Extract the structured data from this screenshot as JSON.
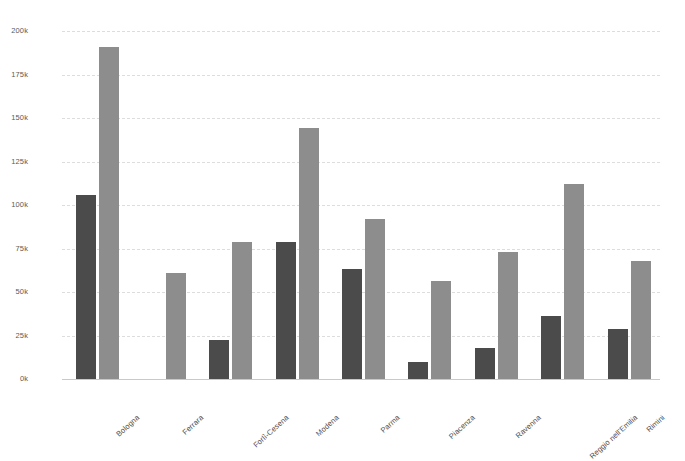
{
  "chart_data": {
    "type": "bar",
    "title": "",
    "subtitle": "",
    "xlabel": "",
    "ylabel": "",
    "ylim": [
      0,
      200000
    ],
    "grid": true,
    "legend_position": "none",
    "orientation": "vertical",
    "bar_mode": "grouped",
    "categories": [
      "Bologna",
      "Ferrara",
      "Forlì-Cesena",
      "Modena",
      "Parma",
      "Piacenza",
      "Ravenna",
      "Reggio nell'Emilia",
      "Rimini"
    ],
    "ytick_labels": [
      "0k",
      "25k",
      "50k",
      "75k",
      "100k",
      "125k",
      "150k",
      "175k",
      "200k"
    ],
    "ytick_values": [
      0,
      25000,
      50000,
      75000,
      100000,
      125000,
      150000,
      175000,
      200000
    ],
    "series": [
      {
        "name": "series-1",
        "color": "#4b4b4b",
        "values": [
          106000,
          0,
          22500,
          79000,
          63000,
          10000,
          18000,
          36500,
          29000
        ]
      },
      {
        "name": "series-2",
        "color": "#8d8d8d",
        "values": [
          191000,
          61000,
          79000,
          144000,
          92000,
          56500,
          73000,
          112000,
          68000
        ]
      }
    ]
  },
  "style": {
    "background": "#ffffff",
    "grid_color": "#dddddd",
    "axis_color": "#c9c9c9",
    "tick_text_color": "#5a5a5a",
    "label_text_color": "#4d4d4d"
  }
}
